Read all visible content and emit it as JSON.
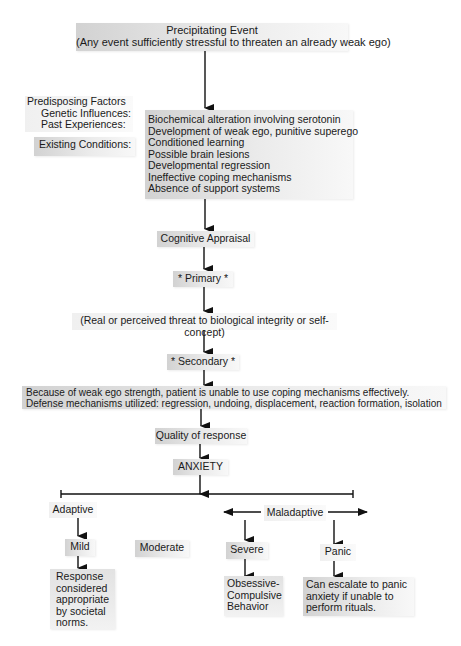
{
  "precipitating_event": {
    "title": "Precipitating Event",
    "subtitle": "(Any event sufficiently stressful to threaten an already weak ego)"
  },
  "predisposing_factors": {
    "title": "Predisposing Factors",
    "genetic": "Genetic Influences:",
    "past": "Past Experiences:",
    "existing": "Existing Conditions:"
  },
  "factors_list": [
    "Biochemical alteration involving serotonin",
    "Development of weak ego, punitive superego",
    "Conditioned learning",
    "Possible brain lesions",
    "Developmental regression",
    "Ineffective coping mechanisms",
    "Absence of support systems"
  ],
  "cognitive_appraisal": "Cognitive Appraisal",
  "primary": "* Primary *",
  "primary_detail": "(Real or perceived threat to biological integrity or self-concept)",
  "secondary": "* Secondary *",
  "secondary_detail": {
    "line1": "Because of weak ego strength, patient is unable to use coping mechanisms effectively.",
    "line2": "Defense mechanisms utilized: regression, undoing, displacement, reaction formation, isolation"
  },
  "quality_of_response": "Quality of response",
  "anxiety": "ANXIETY",
  "continuum": {
    "adaptive": "Adaptive",
    "maladaptive": "Maladaptive"
  },
  "levels": {
    "mild": "Mild",
    "moderate": "Moderate",
    "severe": "Severe",
    "panic": "Panic"
  },
  "outcomes": {
    "mild": [
      "Response",
      "considered",
      "appropriate",
      "by societal",
      "norms."
    ],
    "severe": [
      "Obsessive-",
      "Compulsive",
      "Behavior"
    ],
    "panic": [
      "Can escalate to panic",
      "anxiety if unable to",
      "perform rituals."
    ]
  }
}
